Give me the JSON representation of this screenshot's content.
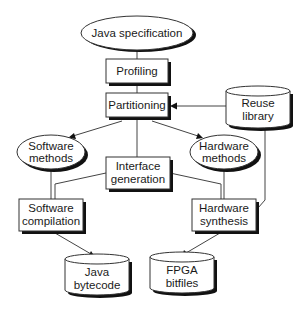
{
  "diagram": {
    "nodes": {
      "java_spec": {
        "label": "Java specification",
        "shape": "ellipse"
      },
      "profiling": {
        "label": "Profiling",
        "shape": "box"
      },
      "partitioning": {
        "label": "Partitioning",
        "shape": "box"
      },
      "reuse_library": {
        "line1": "Reuse",
        "line2": "library",
        "shape": "cylinder"
      },
      "software_methods": {
        "line1": "Software",
        "line2": "methods",
        "shape": "ellipse"
      },
      "hardware_methods": {
        "line1": "Hardware",
        "line2": "methods",
        "shape": "ellipse"
      },
      "interface_generation": {
        "line1": "Interface",
        "line2": "generation",
        "shape": "box"
      },
      "software_compilation": {
        "line1": "Software",
        "line2": "compilation",
        "shape": "box"
      },
      "hardware_synthesis": {
        "line1": "Hardware",
        "line2": "synthesis",
        "shape": "box"
      },
      "java_bytecode": {
        "line1": "Java",
        "line2": "bytecode",
        "shape": "cylinder"
      },
      "fpga_bitfiles": {
        "line1": "FPGA",
        "line2": "bitfiles",
        "shape": "cylinder"
      }
    },
    "edges": [
      {
        "from": "java_spec",
        "to": "profiling",
        "arrow": false
      },
      {
        "from": "profiling",
        "to": "partitioning",
        "arrow": false
      },
      {
        "from": "reuse_library",
        "to": "partitioning",
        "arrow": true
      },
      {
        "from": "partitioning",
        "to": "software_methods",
        "arrow": true
      },
      {
        "from": "partitioning",
        "to": "hardware_methods",
        "arrow": true
      },
      {
        "from": "partitioning",
        "to": "interface_generation",
        "arrow": false
      },
      {
        "from": "software_methods",
        "to": "software_compilation",
        "arrow": false
      },
      {
        "from": "hardware_methods",
        "to": "hardware_synthesis",
        "arrow": false
      },
      {
        "from": "interface_generation",
        "to": "software_compilation",
        "arrow": false
      },
      {
        "from": "interface_generation",
        "to": "hardware_synthesis",
        "arrow": false
      },
      {
        "from": "reuse_library",
        "to": "hardware_synthesis",
        "arrow": false
      },
      {
        "from": "software_compilation",
        "to": "java_bytecode",
        "arrow": true
      },
      {
        "from": "hardware_synthesis",
        "to": "fpga_bitfiles",
        "arrow": true
      }
    ]
  }
}
